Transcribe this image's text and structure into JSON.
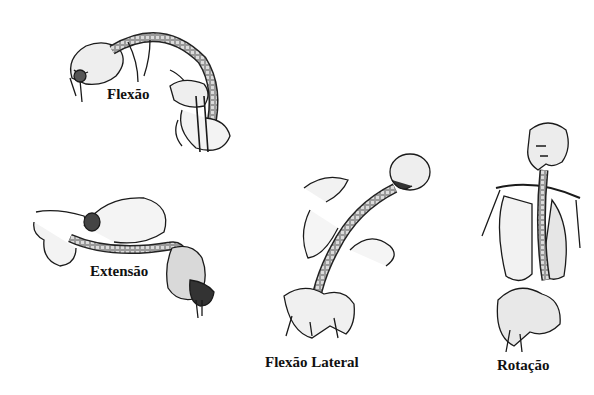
{
  "diagram": {
    "type": "anatomical-illustration",
    "panels": [
      {
        "id": "flexion",
        "label": "Flexão"
      },
      {
        "id": "extension",
        "label": "Extensão"
      },
      {
        "id": "lateral-flexion",
        "label": "Flexão Lateral"
      },
      {
        "id": "rotation",
        "label": "Rotação"
      }
    ],
    "colors": {
      "ink": "#1a1a1a",
      "shade": "#7a7a7a",
      "bone": "#e8e8e8",
      "background": "#ffffff"
    }
  }
}
